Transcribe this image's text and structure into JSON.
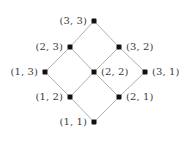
{
  "figure": {
    "width": 188,
    "height": 143,
    "background_color": "#ffffff",
    "edge_color": "#9a9a9a",
    "node_color": "#111111",
    "label_color": "#3a3a3a"
  },
  "chart_data": {
    "type": "diagram",
    "title": "",
    "xlabel": "",
    "ylabel": "",
    "nodes": [
      {
        "id": "3-3",
        "label": "(3, 3)",
        "x": 94,
        "y": 21,
        "label_pos": "left"
      },
      {
        "id": "2-3",
        "label": "(2, 3)",
        "x": 70,
        "y": 47,
        "label_pos": "left"
      },
      {
        "id": "3-2",
        "label": "(3, 2)",
        "x": 119,
        "y": 47,
        "label_pos": "right"
      },
      {
        "id": "1-3",
        "label": "(1, 3)",
        "x": 45,
        "y": 72,
        "label_pos": "left"
      },
      {
        "id": "2-2",
        "label": "(2, 2)",
        "x": 94,
        "y": 72,
        "label_pos": "right"
      },
      {
        "id": "3-1",
        "label": "(3, 1)",
        "x": 145,
        "y": 72,
        "label_pos": "right"
      },
      {
        "id": "1-2",
        "label": "(1, 2)",
        "x": 70,
        "y": 97,
        "label_pos": "left"
      },
      {
        "id": "2-1",
        "label": "(2, 1)",
        "x": 119,
        "y": 97,
        "label_pos": "right"
      },
      {
        "id": "1-1",
        "label": "(1, 1)",
        "x": 94,
        "y": 122,
        "label_pos": "left"
      }
    ],
    "edges": [
      {
        "from": "2-3",
        "to": "3-3"
      },
      {
        "from": "3-2",
        "to": "3-3"
      },
      {
        "from": "1-3",
        "to": "2-3"
      },
      {
        "from": "2-2",
        "to": "2-3"
      },
      {
        "from": "2-2",
        "to": "3-2"
      },
      {
        "from": "3-1",
        "to": "3-2"
      },
      {
        "from": "1-2",
        "to": "1-3"
      },
      {
        "from": "1-2",
        "to": "2-2"
      },
      {
        "from": "2-1",
        "to": "2-2"
      },
      {
        "from": "2-1",
        "to": "3-1"
      },
      {
        "from": "1-1",
        "to": "1-2"
      },
      {
        "from": "1-1",
        "to": "2-1"
      }
    ],
    "legend": [],
    "grid": false
  }
}
